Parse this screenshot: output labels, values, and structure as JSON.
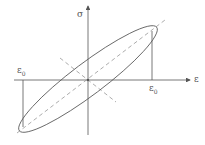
{
  "diagram": {
    "axes": {
      "x_label": "ε",
      "y_label": "σ"
    },
    "annotations": {
      "left_strain": "ε",
      "left_strain_sub": "0",
      "right_strain": "ε",
      "right_strain_sub": "0"
    },
    "colors": {
      "line": "#555555",
      "dashed": "#888888",
      "background": "#ffffff"
    }
  }
}
